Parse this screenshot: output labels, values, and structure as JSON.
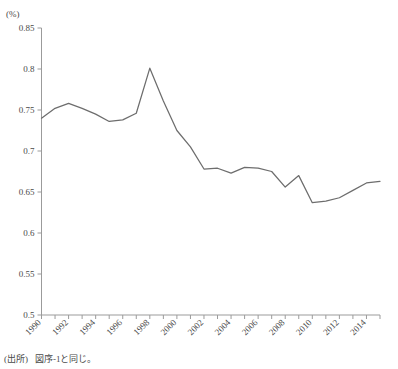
{
  "figure": {
    "unit_label": "(%)",
    "faded_header": "",
    "source_label": "(出所)",
    "source_text": "図序-1と同じ。"
  },
  "chart_data": {
    "type": "line",
    "title": "",
    "xlabel": "",
    "ylabel": "(%)",
    "ylim": [
      0.5,
      0.85
    ],
    "xlim": [
      1990,
      2015
    ],
    "grid": false,
    "legend": "none",
    "ytick_labels": [
      "0.85",
      "0.8",
      "0.75",
      "0.7",
      "0.65",
      "0.6",
      "0.55",
      "0.5"
    ],
    "ytick_values": [
      0.85,
      0.8,
      0.75,
      0.7,
      0.65,
      0.6,
      0.55,
      0.5
    ],
    "xtick_labels": [
      "1990",
      "1992",
      "1994",
      "1996",
      "1998",
      "2000",
      "2002",
      "2004",
      "2006",
      "2008",
      "2010",
      "2012",
      "2014"
    ],
    "xtick_values": [
      1990,
      1992,
      1994,
      1996,
      1998,
      2000,
      2002,
      2004,
      2006,
      2008,
      2010,
      2012,
      2014
    ],
    "x": [
      1990,
      1991,
      1992,
      1993,
      1994,
      1995,
      1996,
      1997,
      1998,
      1999,
      2000,
      2001,
      2002,
      2003,
      2004,
      2005,
      2006,
      2007,
      2008,
      2009,
      2010,
      2011,
      2012,
      2013,
      2014,
      2015
    ],
    "values": [
      0.74,
      0.752,
      0.758,
      0.752,
      0.745,
      0.736,
      0.738,
      0.746,
      0.801,
      0.761,
      0.725,
      0.705,
      0.678,
      0.679,
      0.673,
      0.68,
      0.679,
      0.675,
      0.656,
      0.67,
      0.637,
      0.639,
      0.643,
      0.652,
      0.661,
      0.663
    ],
    "series": [
      {
        "name": "series-1",
        "color": "#6d6d6d",
        "values": [
          0.74,
          0.752,
          0.758,
          0.752,
          0.745,
          0.736,
          0.738,
          0.746,
          0.801,
          0.761,
          0.725,
          0.705,
          0.678,
          0.679,
          0.673,
          0.68,
          0.679,
          0.675,
          0.656,
          0.67,
          0.637,
          0.639,
          0.643,
          0.652,
          0.661,
          0.663
        ]
      }
    ]
  },
  "colors": {
    "line": "#6d6d6d",
    "axis": "#9b9b9b",
    "text": "#4a4a4a",
    "background": "#ffffff"
  }
}
